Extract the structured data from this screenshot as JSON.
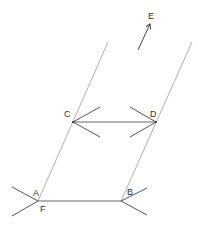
{
  "diagram": {
    "type": "geometric construction (parallel lines / translation)",
    "points": [
      {
        "name": "A",
        "label": "A",
        "x": 38,
        "y": 201
      },
      {
        "name": "F",
        "label": "F",
        "x": 38,
        "y": 201
      },
      {
        "name": "B",
        "label": "B",
        "x": 121,
        "y": 201
      },
      {
        "name": "C",
        "label": "C",
        "x": 73,
        "y": 122
      },
      {
        "name": "D",
        "label": "D",
        "x": 156,
        "y": 122
      },
      {
        "name": "E",
        "label": "E",
        "x": 151,
        "y": 22
      }
    ],
    "labels": {
      "A": "A",
      "B": "B",
      "C": "C",
      "D": "D",
      "E": "E",
      "F": "F"
    },
    "lines": [
      {
        "name": "left-line",
        "from": [
          108,
          42
        ],
        "to": [
          38,
          201
        ]
      },
      {
        "name": "right-line",
        "from": [
          192,
          42
        ],
        "to": [
          121,
          201
        ]
      },
      {
        "name": "segment-AB",
        "from": [
          38,
          201
        ],
        "to": [
          121,
          201
        ]
      },
      {
        "name": "segment-CD",
        "from": [
          73,
          122
        ],
        "to": [
          156,
          122
        ]
      }
    ],
    "arrow_E": {
      "from": [
        138,
        50
      ],
      "to": [
        151,
        22
      ]
    },
    "colors": {
      "background": "#ffffff",
      "line": "#9a9a9a",
      "mark": "#555555",
      "text": "#333333"
    }
  }
}
